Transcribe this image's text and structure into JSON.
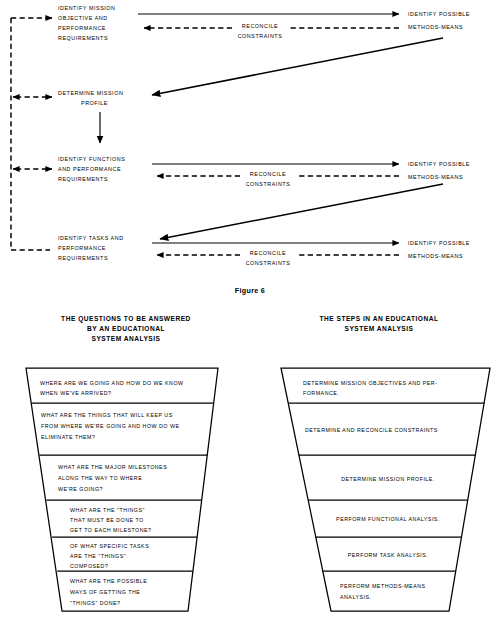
{
  "figure": {
    "caption": "Figure 6"
  },
  "flow_diagram": {
    "stages": [
      {
        "id": "stage-1",
        "lines": [
          "IDENTIFY MISSION",
          "OBJECTIVE AND",
          "PERFORMANCE",
          "REQUIREMENTS"
        ]
      },
      {
        "id": "stage-2",
        "lines": [
          "DETERMINE MISSION",
          "PROFILE"
        ]
      },
      {
        "id": "stage-3",
        "lines": [
          "IDENTIFY FUNCTIONS",
          "AND PERFORMANCE",
          "REQUIREMENTS"
        ]
      },
      {
        "id": "stage-4",
        "lines": [
          "IDENTIFY TASKS AND",
          "PERFORMANCE",
          "REQUIREMENTS"
        ]
      }
    ],
    "methods_label_lines": [
      "IDENTIFY POSSIBLE",
      "METHODS-MEANS"
    ],
    "reconcile_label_lines": [
      "RECONCILE",
      "CONSTRAINTS"
    ],
    "methods_rows": [
      {
        "id": "methods-1"
      },
      {
        "id": "methods-2"
      },
      {
        "id": "methods-3"
      }
    ]
  },
  "funnels": [
    {
      "id": "questions-funnel",
      "header_lines": [
        "THE QUESTIONS TO BE ANSWERED",
        "BY AN EDUCATIONAL",
        "SYSTEM ANALYSIS"
      ],
      "rows": [
        {
          "id": "q-row-1",
          "align": "left",
          "lines": [
            "WHERE ARE WE GOING AND HOW DO WE KNOW",
            "WHEN WE'VE ARRIVED?"
          ]
        },
        {
          "id": "q-row-2",
          "align": "left",
          "lines": [
            "WHAT ARE THE THINGS THAT WILL KEEP US",
            "FROM WHERE WE'RE GOING AND HOW DO WE",
            "ELIMINATE THEM?"
          ]
        },
        {
          "id": "q-row-3",
          "align": "left",
          "lines": [
            "WHAT ARE THE MAJOR MILESTONES",
            "ALONG THE WAY TO WHERE",
            "WE'RE GOING?"
          ]
        },
        {
          "id": "q-row-4",
          "align": "left",
          "lines": [
            "WHAT ARE THE \"THINGS\"",
            "THAT MUST BE DONE TO",
            "GET TO EACH MILESTONE?"
          ]
        },
        {
          "id": "q-row-5",
          "align": "left",
          "lines": [
            "OF WHAT SPECIFIC TASKS",
            "ARE THE \"THINGS\"",
            "COMPOSED?"
          ]
        },
        {
          "id": "q-row-6",
          "align": "left",
          "lines": [
            "WHAT ARE THE POSSIBLE",
            "WAYS OF GETTING THE",
            "\"THINGS\" DONE?"
          ]
        }
      ]
    },
    {
      "id": "steps-funnel",
      "header_lines": [
        "THE STEPS IN AN EDUCATIONAL",
        "SYSTEM ANALYSIS"
      ],
      "rows": [
        {
          "id": "s-row-1",
          "align": "left",
          "lines": [
            "DETERMINE  MISSION  OBJECTIVES  AND  PER-",
            "FORMANCE."
          ]
        },
        {
          "id": "s-row-2",
          "align": "left",
          "lines": [
            "DETERMINE  AND  RECONCILE  CONSTRAINTS"
          ]
        },
        {
          "id": "s-row-3",
          "align": "center",
          "lines": [
            "DETERMINE  MISSION  PROFILE."
          ]
        },
        {
          "id": "s-row-4",
          "align": "center",
          "lines": [
            "PERFORM  FUNCTIONAL  ANALYSIS."
          ]
        },
        {
          "id": "s-row-5",
          "align": "center",
          "lines": [
            "PERFORM  TASK  ANALYSIS."
          ]
        },
        {
          "id": "s-row-6",
          "align": "left",
          "lines": [
            "PERFORM  METHODS-MEANS",
            "ANALYSIS."
          ]
        }
      ]
    }
  ],
  "colors": {
    "ink": "#000000",
    "paper": "#ffffff"
  }
}
